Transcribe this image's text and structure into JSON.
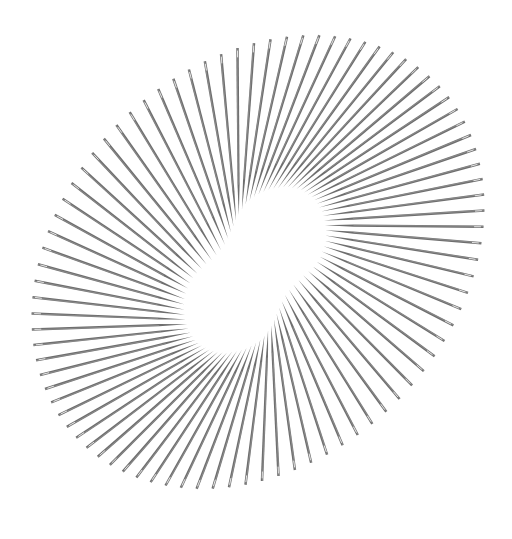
{
  "image": {
    "subject": "Sewing needles arranged radially around an empty kidney-shaped centre",
    "background": "#ffffff",
    "needle_color": "#6e6e6e",
    "needle_highlight": "#a8a8a8",
    "needle_count": 86
  },
  "needles": {
    "outer_center": [
      258,
      262
    ],
    "outer_rx": 232,
    "outer_ry": 228,
    "outer_rotation_deg": -35,
    "outer_squash": 0.78,
    "inner_center": [
      255,
      270
    ],
    "inner_rx": 92,
    "inner_ry": 58,
    "inner_rotation_deg": -55,
    "inner_waist": 0.55
  }
}
